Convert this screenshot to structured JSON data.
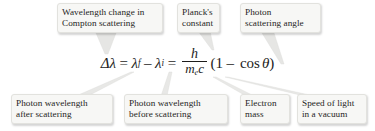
{
  "figure": {
    "type": "annotated-equation-diagram",
    "background_color": "#ffffff",
    "callout_fill": "#f7f7f5",
    "text_color": "#262524"
  },
  "equation": {
    "delta": "Δ",
    "lambda": "λ",
    "lhs_symbol": "Δλ",
    "equals_1": "=",
    "lambda_f_base": "λ",
    "lambda_f_sub": "f",
    "minus": "–",
    "lambda_i_base": "λ",
    "lambda_i_sub": "i",
    "equals_2": "=",
    "fraction_numerator": "h",
    "fraction_denominator_m": "m",
    "fraction_denominator_m_sub": "e",
    "fraction_denominator_c": "c",
    "open_paren": "(",
    "one": "1",
    "minus_2": "–",
    "cos": "cos",
    "theta": "θ",
    "close_paren": ")",
    "plain_text": "Δλ = λᶠ – λᵢ = h/(mₑc) (1 – cos θ)"
  },
  "callouts": {
    "top": [
      {
        "id": "wavelength-change",
        "text": "Wavelength change in\nCompton scattering",
        "target": "Δλ"
      },
      {
        "id": "plancks-constant",
        "text": "Planck's\nconstant",
        "target": "h"
      },
      {
        "id": "scattering-angle",
        "text": "Photon\nscattering angle",
        "target": "θ"
      }
    ],
    "bottom": [
      {
        "id": "photon-wavelength-after",
        "text": "Photon wavelength\nafter scattering",
        "target": "λᶠ"
      },
      {
        "id": "photon-wavelength-before",
        "text": "Photon wavelength\nbefore scattering",
        "target": "λᵢ"
      },
      {
        "id": "electron-mass",
        "text": "Electron\nmass",
        "target": "mₑ"
      },
      {
        "id": "speed-of-light",
        "text": "Speed of light\nin a vacuum",
        "target": "c"
      }
    ]
  }
}
